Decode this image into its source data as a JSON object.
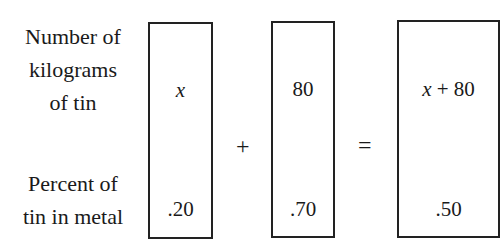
{
  "row_labels": {
    "top": [
      "Number of",
      "kilograms",
      "of tin"
    ],
    "bottom": [
      "Percent of",
      "tin in metal"
    ]
  },
  "boxes": [
    {
      "amount": "x",
      "percent": ".20"
    },
    {
      "amount": "80",
      "percent": ".70"
    },
    {
      "amount_var": "x",
      "amount_op": " + ",
      "amount_num": "80",
      "percent": ".50"
    }
  ],
  "operators": {
    "plus": "+",
    "equals": "="
  }
}
